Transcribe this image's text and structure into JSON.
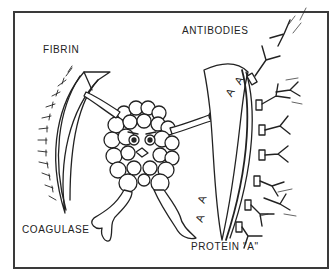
{
  "illustration": {
    "style": "black-and-white line art cartoon",
    "subject": "bacterium defending itself with shields against antibodies",
    "colors": {
      "ink": "#222222",
      "paper": "#ffffff",
      "frame": "#3a3a3a"
    },
    "labels": {
      "fibrin": "FIBRIN",
      "antibodies": "ANTIBODIES",
      "coagulase": "COAGULASE",
      "protein_a": "PROTEIN \"A\""
    },
    "shield_right_markings": [
      "A",
      "A",
      "A",
      "A"
    ]
  }
}
